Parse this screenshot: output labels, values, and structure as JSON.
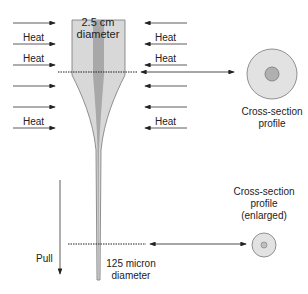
{
  "diagram": {
    "preform_label": [
      "2.5 cm",
      "diameter"
    ],
    "heat_label": "Heat",
    "left_heat_labels_rows": [
      1,
      2,
      5
    ],
    "right_heat_labels_rows": [
      1,
      2,
      5
    ],
    "cross_section_label": [
      "Cross-section",
      "profile"
    ],
    "cross_section_enlarged_label": [
      "Cross-section",
      "profile",
      "(enlarged)"
    ],
    "fiber_label": [
      "125 micron",
      "diameter"
    ],
    "pull_label": "Pull",
    "colors": {
      "preform_cladding": "#d6d6d6",
      "preform_core": "#a9a9a9",
      "outline": "#555555",
      "arrow": "#333333",
      "circle_outer": "#e0e0e0",
      "circle_inner": "#b0b0b0"
    }
  }
}
